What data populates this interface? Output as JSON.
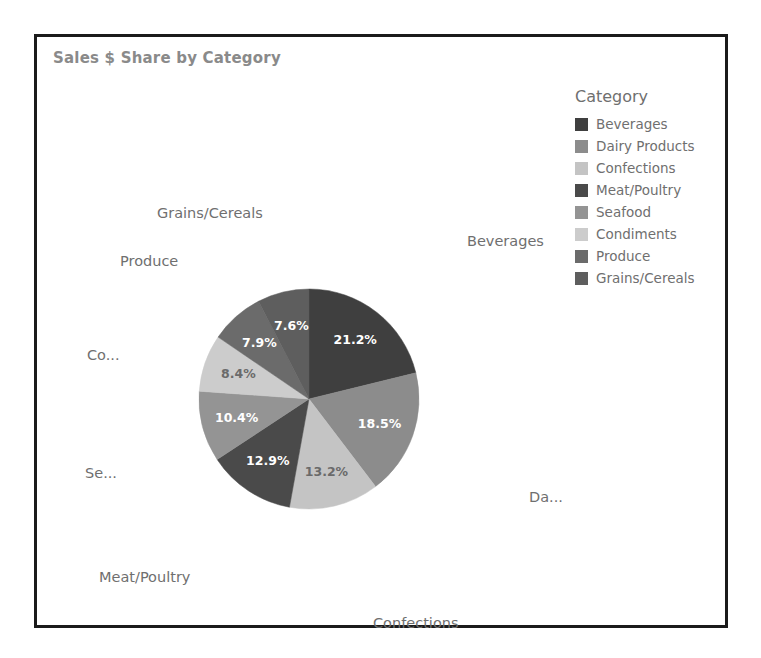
{
  "chart": {
    "title": "Sales $ Share by Category"
  },
  "legend": {
    "title": "Category",
    "items": [
      {
        "label": "Beverages",
        "color": "#3f3f3f"
      },
      {
        "label": "Dairy Products",
        "color": "#8c8c8c"
      },
      {
        "label": "Confections",
        "color": "#c4c4c4"
      },
      {
        "label": "Meat/Poultry",
        "color": "#4a4a4a"
      },
      {
        "label": "Seafood",
        "color": "#949494"
      },
      {
        "label": "Condiments",
        "color": "#cccccc"
      },
      {
        "label": "Produce",
        "color": "#6b6b6b"
      },
      {
        "label": "Grains/Cereals",
        "color": "#5e5e5e"
      }
    ]
  },
  "outer_labels": [
    {
      "text": "Beverages",
      "left": 430,
      "top": 196
    },
    {
      "text": "Da...",
      "left": 492,
      "top": 452
    },
    {
      "text": "Confections",
      "left": 336,
      "top": 578
    },
    {
      "text": "Meat/Poultry",
      "left": 62,
      "top": 532
    },
    {
      "text": "Se...",
      "left": 48,
      "top": 428
    },
    {
      "text": "Co...",
      "left": 50,
      "top": 310
    },
    {
      "text": "Produce",
      "left": 83,
      "top": 216
    },
    {
      "text": "Grains/Cereals",
      "left": 120,
      "top": 168
    }
  ],
  "chart_data": {
    "type": "pie",
    "title": "Sales $ Share by Category",
    "legend_title": "Category",
    "legend_position": "right",
    "value_unit": "percent",
    "value_format": "0.0%",
    "start_angle_deg": 0,
    "direction": "clockwise",
    "categories": [
      "Beverages",
      "Dairy Products",
      "Confections",
      "Meat/Poultry",
      "Seafood",
      "Condiments",
      "Produce",
      "Grains/Cereals"
    ],
    "values": [
      21.2,
      18.5,
      13.2,
      12.9,
      10.4,
      8.4,
      7.9,
      7.6
    ],
    "labels": [
      "21.2%",
      "18.5%",
      "13.2%",
      "12.9%",
      "10.4%",
      "8.4%",
      "7.9%",
      "7.6%"
    ],
    "colors": [
      "#3f3f3f",
      "#8c8c8c",
      "#c4c4c4",
      "#4a4a4a",
      "#949494",
      "#cccccc",
      "#6b6b6b",
      "#5e5e5e"
    ],
    "label_colors": [
      "#ffffff",
      "#ffffff",
      "#6a6a6a",
      "#ffffff",
      "#ffffff",
      "#6a6a6a",
      "#ffffff",
      "#ffffff"
    ]
  }
}
